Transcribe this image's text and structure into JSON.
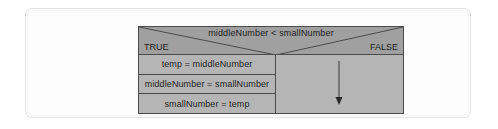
{
  "diagram": {
    "type": "nassi-shneiderman-structogram",
    "condition": {
      "text": "middleNumber < smallNumber",
      "true_label": "TRUE",
      "false_label": "FALSE"
    },
    "true_branch": {
      "statements": [
        "temp = middleNumber",
        "middleNumber = smallNumber",
        "smallNumber = temp"
      ]
    },
    "false_branch": {
      "statements": [],
      "marker": "down-arrow-noop"
    },
    "colors": {
      "header_fill": "#a0a0a0",
      "statement_fill": "#b5b5b5",
      "branch_fill": "#b5b5b5",
      "outline": "#4b4b4b",
      "text": "#1d1d1d",
      "frame_border": "#e2e2e2",
      "page_background": "#ffffff"
    }
  }
}
